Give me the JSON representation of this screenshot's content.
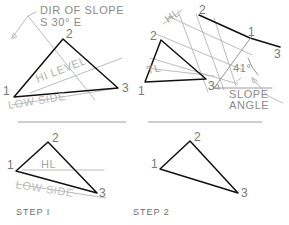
{
  "drawing": {
    "title_visible": false,
    "ink_dark": "#111111",
    "ink_light": "#b4b4b4",
    "ink_mid": "#9a9a9a",
    "background": "#ffffff"
  },
  "panels": [
    {
      "id": "top-left",
      "caption": "",
      "labels": {
        "dir_of_slope_line1": "DIR OF SLOPE",
        "dir_of_slope_line2": "S 30° E",
        "hi_level": "HI LEVEL",
        "low_side": "LOW SIDE",
        "v1": "1",
        "v2": "2",
        "v3": "3"
      }
    },
    {
      "id": "top-right",
      "caption": "",
      "labels": {
        "hl": "HL",
        "tl": "TL",
        "slope_angle_line1": "SLOPE",
        "slope_angle_line2": "ANGLE",
        "angle_value": "41°",
        "v1": "1",
        "v2": "2",
        "v3": "3",
        "e1": "1",
        "e2": "2",
        "e3": "3"
      }
    },
    {
      "id": "bottom-left",
      "caption": "STEP I",
      "labels": {
        "hl": "HL",
        "low_side": "LOW SIDE",
        "v1": "1",
        "v2": "2",
        "v3": "3"
      }
    },
    {
      "id": "bottom-right",
      "caption": "STEP 2",
      "labels": {
        "v1": "1",
        "v2": "2",
        "v3": "3"
      }
    }
  ]
}
